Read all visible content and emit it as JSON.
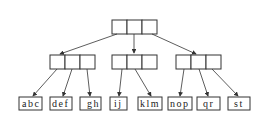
{
  "diagram": {
    "type": "tree",
    "root": {
      "slots": 3
    },
    "internal_nodes": [
      {
        "slots": 3,
        "children": [
          "abc",
          "def",
          "gh"
        ]
      },
      {
        "slots": 3,
        "children": [
          "ij",
          "klm"
        ]
      },
      {
        "slots": 3,
        "children": [
          "nop",
          "qr",
          "st"
        ]
      }
    ],
    "leaves": [
      {
        "label": "abc"
      },
      {
        "label": "def"
      },
      {
        "label": "gh"
      },
      {
        "label": "ij"
      },
      {
        "label": "klm"
      },
      {
        "label": "nop"
      },
      {
        "label": "qr"
      },
      {
        "label": "st"
      }
    ]
  }
}
